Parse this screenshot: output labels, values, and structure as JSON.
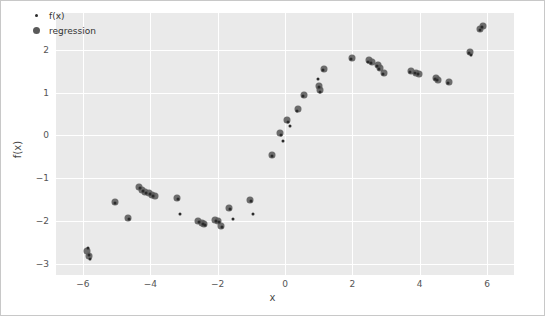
{
  "figure": {
    "background": "#ffffff",
    "plot_background": "#eaeaea",
    "grid_color": "#ffffff",
    "border_color": "#c8c8c8"
  },
  "legend": {
    "position": "top-left",
    "entries": [
      {
        "label": "f(x)",
        "marker": "small-dot",
        "color": "#2b2b2b"
      },
      {
        "label": "regression",
        "marker": "large-dot",
        "color": "#5a5a5a"
      }
    ]
  },
  "axes": {
    "xlabel": "x",
    "ylabel": "f(x)",
    "xticks": [
      "-6",
      "-4",
      "-2",
      "0",
      "2",
      "4",
      "6"
    ],
    "xtick_values": [
      -6,
      -4,
      -2,
      0,
      2,
      4,
      6
    ],
    "yticks": [
      "2",
      "1",
      "0",
      "-1",
      "-2",
      "-3"
    ],
    "ytick_values": [
      2,
      1,
      0,
      -1,
      -2,
      -3
    ],
    "xlim": [
      -6.8,
      6.8
    ],
    "ylim": [
      -3.25,
      2.85
    ],
    "grid": true
  },
  "chart_data": {
    "type": "scatter",
    "title": "",
    "xlabel": "x",
    "ylabel": "f(x)",
    "xlim": [
      -6.8,
      6.8
    ],
    "ylim": [
      -3.25,
      2.85
    ],
    "grid": true,
    "legend_position": "top-left",
    "series": [
      {
        "name": "f(x)",
        "marker": "small-dot",
        "color": "#2b2b2b",
        "points": [
          [
            -5.85,
            -2.62
          ],
          [
            -5.82,
            -2.78
          ],
          [
            -5.78,
            -2.88
          ],
          [
            -5.05,
            -1.58
          ],
          [
            -4.62,
            -1.95
          ],
          [
            -4.32,
            -1.22
          ],
          [
            -4.22,
            -1.3
          ],
          [
            -4.12,
            -1.33
          ],
          [
            -4.02,
            -1.36
          ],
          [
            -3.92,
            -1.4
          ],
          [
            -3.18,
            -1.48
          ],
          [
            -3.12,
            -1.82
          ],
          [
            -2.55,
            -2.02
          ],
          [
            -2.45,
            -2.05
          ],
          [
            -2.38,
            -2.08
          ],
          [
            -2.05,
            -1.98
          ],
          [
            -1.95,
            -2.02
          ],
          [
            -1.88,
            -2.12
          ],
          [
            -1.62,
            -1.72
          ],
          [
            -1.55,
            -1.95
          ],
          [
            -1.02,
            -1.52
          ],
          [
            -0.95,
            -1.82
          ],
          [
            -0.38,
            -0.48
          ],
          [
            -0.12,
            0.02
          ],
          [
            -0.05,
            -0.12
          ],
          [
            0.08,
            0.32
          ],
          [
            0.15,
            0.22
          ],
          [
            0.35,
            0.58
          ],
          [
            0.52,
            0.92
          ],
          [
            0.98,
            1.32
          ],
          [
            1.02,
            1.12
          ],
          [
            1.05,
            1.02
          ],
          [
            1.12,
            1.52
          ],
          [
            1.95,
            1.78
          ],
          [
            2.45,
            1.72
          ],
          [
            2.55,
            1.68
          ],
          [
            2.72,
            1.62
          ],
          [
            2.78,
            1.55
          ],
          [
            2.92,
            1.42
          ],
          [
            3.72,
            1.48
          ],
          [
            3.85,
            1.45
          ],
          [
            3.95,
            1.42
          ],
          [
            4.45,
            1.32
          ],
          [
            4.52,
            1.28
          ],
          [
            4.85,
            1.22
          ],
          [
            5.45,
            1.92
          ],
          [
            5.52,
            1.88
          ],
          [
            5.78,
            2.45
          ],
          [
            5.85,
            2.52
          ]
        ]
      },
      {
        "name": "regression",
        "marker": "large-dot",
        "color": "#5a5a5a",
        "points": [
          [
            -5.88,
            -2.68
          ],
          [
            -5.82,
            -2.8
          ],
          [
            -5.05,
            -1.55
          ],
          [
            -4.65,
            -1.92
          ],
          [
            -4.35,
            -1.2
          ],
          [
            -4.25,
            -1.28
          ],
          [
            -4.15,
            -1.32
          ],
          [
            -4.05,
            -1.35
          ],
          [
            -3.95,
            -1.38
          ],
          [
            -3.85,
            -1.42
          ],
          [
            -3.2,
            -1.45
          ],
          [
            -2.58,
            -2.0
          ],
          [
            -2.48,
            -2.04
          ],
          [
            -2.4,
            -2.07
          ],
          [
            -2.08,
            -1.96
          ],
          [
            -1.98,
            -2.0
          ],
          [
            -1.9,
            -2.1
          ],
          [
            -1.65,
            -1.7
          ],
          [
            -1.05,
            -1.5
          ],
          [
            -0.4,
            -0.45
          ],
          [
            -0.15,
            0.05
          ],
          [
            0.05,
            0.35
          ],
          [
            0.38,
            0.62
          ],
          [
            0.55,
            0.95
          ],
          [
            1.0,
            1.15
          ],
          [
            1.04,
            1.05
          ],
          [
            1.15,
            1.55
          ],
          [
            1.98,
            1.8
          ],
          [
            2.48,
            1.75
          ],
          [
            2.58,
            1.7
          ],
          [
            2.75,
            1.64
          ],
          [
            2.82,
            1.58
          ],
          [
            2.95,
            1.45
          ],
          [
            3.75,
            1.5
          ],
          [
            3.88,
            1.46
          ],
          [
            3.98,
            1.43
          ],
          [
            4.48,
            1.34
          ],
          [
            4.55,
            1.3
          ],
          [
            4.88,
            1.25
          ],
          [
            5.48,
            1.95
          ],
          [
            5.8,
            2.48
          ],
          [
            5.88,
            2.55
          ]
        ]
      }
    ]
  }
}
